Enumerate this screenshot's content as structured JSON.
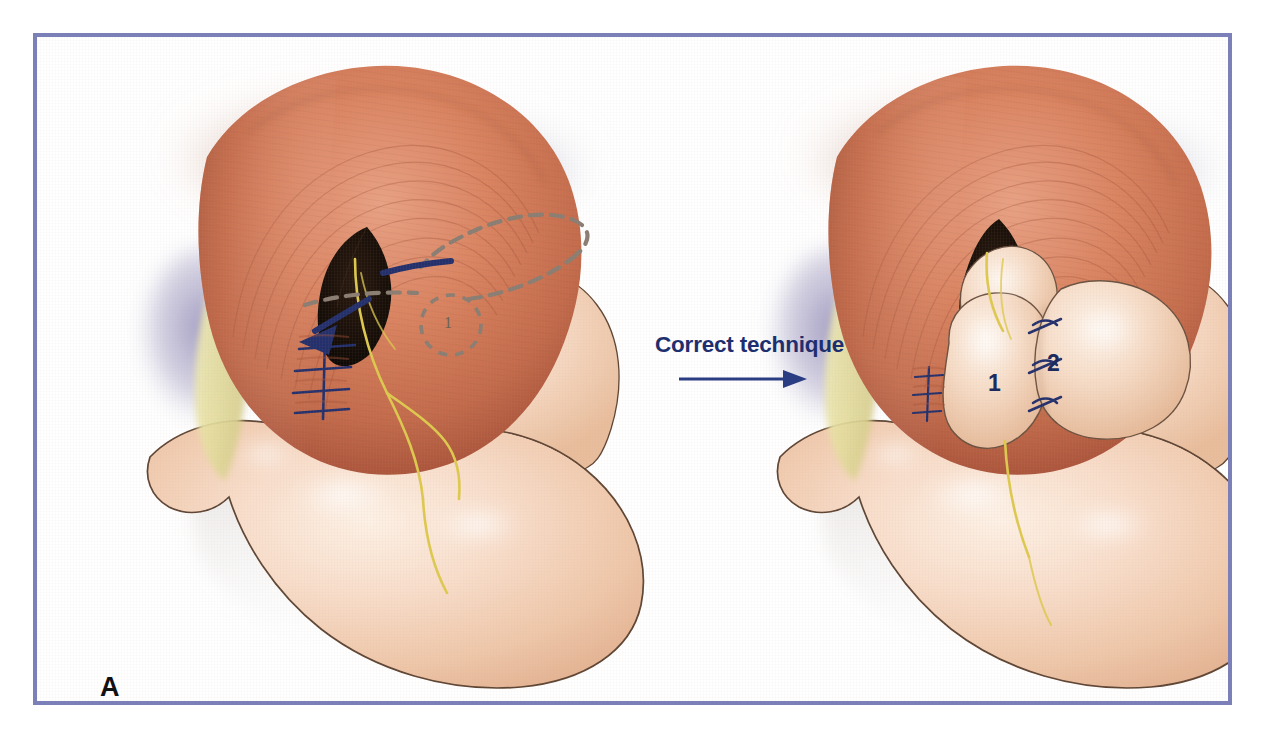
{
  "figure": {
    "panel_label": "A",
    "domain": "medical-illustration",
    "background_color": "#ffffff",
    "frame_color": "#7c80b8",
    "frame_width_px": 4
  },
  "transition": {
    "label": "Correct technique",
    "label_color": "#1d2f6f",
    "arrow_color": "#2a3c82",
    "arrow_direction": "right"
  },
  "palette": {
    "stomach_fill_light": "#fbe6d6",
    "stomach_fill_mid": "#f3cdb2",
    "stomach_fill_deep": "#e6b394",
    "stomach_outline": "#5e4433",
    "crus_muscle_light": "#e08e6e",
    "crus_muscle_mid": "#cf7355",
    "crus_muscle_deep": "#b25a40",
    "crus_striation": "#a9systemic",
    "diaphragm_haze": "#aab0c4",
    "fat_pad": "#e9e4a8",
    "liver_shadow": "#9b96bd",
    "vagus_nerve": "#e4d55c",
    "suture_navy": "#23306b",
    "dashed_marking": "#8a7d72",
    "hiatus_dark": "#140d08",
    "highlight_white": "#ffffff"
  },
  "left_panel": {
    "name": "incorrect-or-pre-wrap-view",
    "annotations": {
      "flap_outline_style": "dashed",
      "flap_outline_color": "#8a7d72",
      "circled_label": "1",
      "direction_arrow_color": "#23306b",
      "direction_arrow_heading": "down-left",
      "crural_suture_count": 4,
      "crural_suture_color": "#23306b"
    },
    "anatomy": [
      "diaphragmatic crura",
      "esophageal hiatus",
      "gastric fundus",
      "lesser curvature",
      "greater curvature",
      "vagus nerve branches",
      "fat pad"
    ]
  },
  "right_panel": {
    "name": "completed-wrap-view",
    "annotations": {
      "wrap_lobe_labels": [
        "1",
        "2"
      ],
      "wrap_label_color": "#1c2b5e",
      "wrap_suture_count": 3,
      "wrap_suture_color": "#23306b",
      "crural_suture_count": 3
    },
    "anatomy": [
      "diaphragmatic crura",
      "fundic wrap lobe 1",
      "fundic wrap lobe 2",
      "gastric body",
      "vagus nerve branches",
      "fat pad"
    ]
  }
}
